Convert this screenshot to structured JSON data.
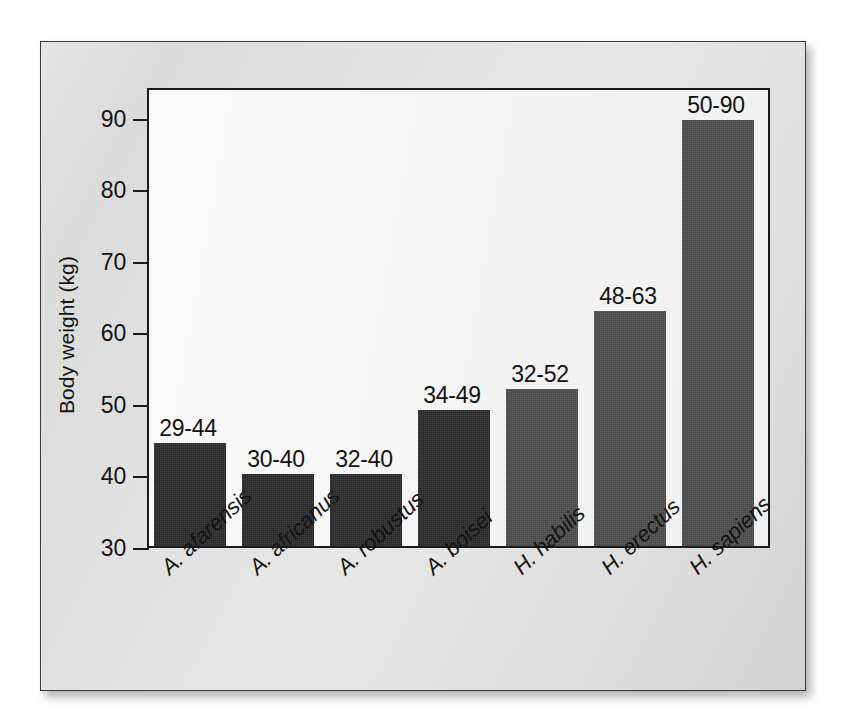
{
  "chart_data": {
    "type": "bar",
    "title": "",
    "xlabel": "",
    "ylabel": "Body weight (kg)",
    "ylim": [
      30,
      95
    ],
    "yticks": [
      30,
      40,
      50,
      60,
      70,
      80,
      90
    ],
    "ytick_labels": [
      "30",
      "40",
      "50",
      "60",
      "70",
      "80",
      "90"
    ],
    "grid": false,
    "legend": "none",
    "categories": [
      "A. afarensis",
      "A. africanus",
      "A. robustus",
      "A. boisei",
      "H. habilis",
      "H. erectus",
      "H. sapiens"
    ],
    "values": [
      44.4,
      40.0,
      40.0,
      49.0,
      52.0,
      62.8,
      89.5
    ],
    "data_labels": [
      "29-44",
      "30-40",
      "32-40",
      "34-49",
      "32-52",
      "48-63",
      "50-90"
    ],
    "ranges": [
      {
        "category": "A. afarensis",
        "min": 29,
        "max": 44,
        "label": "29-44"
      },
      {
        "category": "A. africanus",
        "min": 30,
        "max": 40,
        "label": "30-40"
      },
      {
        "category": "A. robustus",
        "min": 32,
        "max": 40,
        "label": "32-40"
      },
      {
        "category": "A. boisei",
        "min": 34,
        "max": 49,
        "label": "34-49"
      },
      {
        "category": "H. habilis",
        "min": 32,
        "max": 52,
        "label": "32-52"
      },
      {
        "category": "H. erectus",
        "min": 48,
        "max": 63,
        "label": "48-63"
      },
      {
        "category": "H. sapiens",
        "min": 50,
        "max": 90,
        "label": "50-90"
      }
    ],
    "bar_colors": [
      "#2b2b2b",
      "#2b2b2b",
      "#2b2b2b",
      "#2b2b2b",
      "#4d4d4d",
      "#4d4d4d",
      "#4d4d4d"
    ],
    "colors": {
      "australopithecine_bars": "#2b2b2b",
      "homo_bars": "#4d4d4d",
      "plot_background": "#f6f6f6",
      "frame_background": "#e4e4e4",
      "axis_line": "#1a1a1a",
      "text": "#141414"
    }
  }
}
